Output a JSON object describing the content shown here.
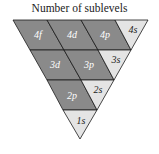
{
  "title": "Number of sublevels",
  "colors": {
    "dark": "#8a8a8a",
    "light": "#e4e4e4",
    "stroke": "#1a1a1a",
    "dark_text": "#ffffff",
    "light_text": "#222222"
  },
  "cells": {
    "c4f": "4f",
    "c4d": "4d",
    "c4p": "4p",
    "c4s": "4s",
    "c3d": "3d",
    "c3p": "3p",
    "c3s": "3s",
    "c2p": "2p",
    "c2s": "2s",
    "c1s": "1s"
  }
}
